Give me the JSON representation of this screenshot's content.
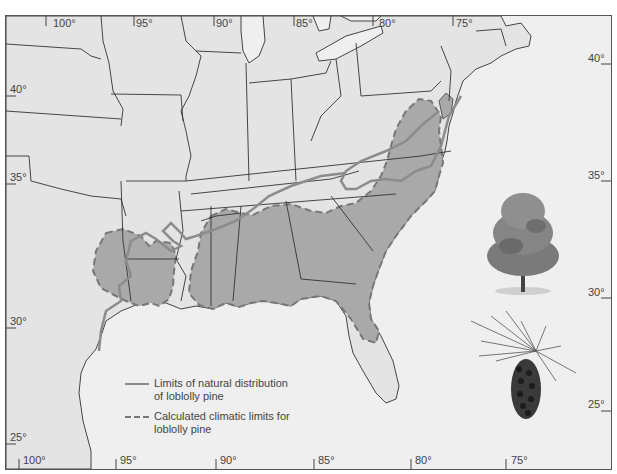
{
  "map": {
    "subject": "Loblolly pine distribution in southeastern United States",
    "colors": {
      "land": "#e4e4e4",
      "water": "#efefef",
      "climatic_zone": "#a9a9a9",
      "natural_limit_line": "#8c8c8c",
      "climatic_limit_line": "#777777",
      "borders": "#333333"
    },
    "longitude_ticks_top": [
      "100°",
      "95°",
      "90°",
      "85°",
      "80°",
      "75°"
    ],
    "longitude_ticks_bottom": [
      "100°",
      "95°",
      "90°",
      "85°",
      "80°",
      "75°"
    ],
    "latitude_ticks_left": [
      "40°",
      "35°",
      "30°",
      "25°"
    ],
    "latitude_ticks_right": [
      "40°",
      "35°",
      "30°",
      "25°"
    ]
  },
  "legend": {
    "items": [
      {
        "style": "solid",
        "label_line1": "Limits of natural distribution",
        "label_line2": "of loblolly pine"
      },
      {
        "style": "dashed",
        "label_line1": "Calculated climatic limits for",
        "label_line2": "loblolly pine"
      }
    ]
  },
  "illustrations": {
    "tree": "loblolly-pine-tree",
    "cone": "loblolly-pine-cone-with-needles"
  }
}
